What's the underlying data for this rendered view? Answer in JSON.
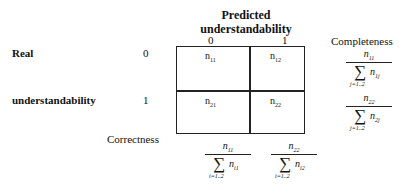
{
  "title": {
    "line1": "Predicted",
    "line2": "understandability"
  },
  "column_headers": [
    "0",
    "1"
  ],
  "row_label": {
    "line1": "Real",
    "line2": "understandability"
  },
  "row_headers": [
    "0",
    "1"
  ],
  "cells": [
    {
      "var": "n",
      "sub": "11"
    },
    {
      "var": "n",
      "sub": "12"
    },
    {
      "var": "n",
      "sub": "21"
    },
    {
      "var": "n",
      "sub": "22"
    }
  ],
  "completeness": {
    "label": "Completeness",
    "formulas": [
      {
        "num_var": "n",
        "num_sub": "11",
        "sigma": "∑",
        "den_var": "n",
        "den_sub": "1j",
        "range": "j=1..2"
      },
      {
        "num_var": "n",
        "num_sub": "22",
        "sigma": "∑",
        "den_var": "n",
        "den_sub": "2j",
        "range": "j=1..2"
      }
    ]
  },
  "correctness": {
    "label": "Correctness",
    "formulas": [
      {
        "num_var": "n",
        "num_sub": "11",
        "sigma": "∑",
        "den_var": "n",
        "den_sub": "i1",
        "range": "i=1..2"
      },
      {
        "num_var": "n",
        "num_sub": "22",
        "sigma": "∑",
        "den_var": "n",
        "den_sub": "i2",
        "range": "i=1..2"
      }
    ]
  }
}
